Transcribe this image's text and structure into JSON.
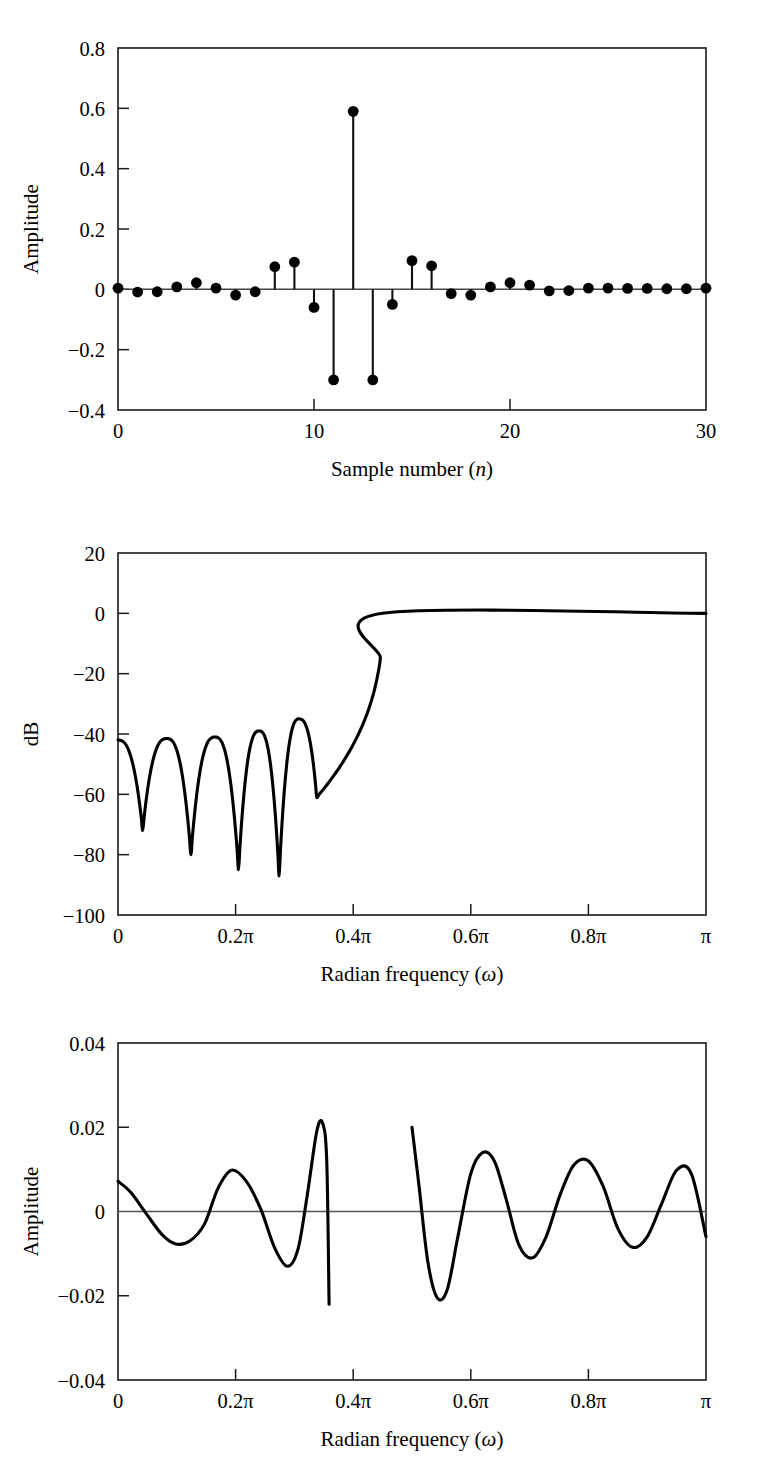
{
  "figure": {
    "panels": [
      {
        "caption": "(a)",
        "xlabel_main": "Sample number (",
        "xlabel_var": "n",
        "xlabel_tail": ")",
        "ylabel": "Amplitude"
      },
      {
        "caption": "(b)",
        "xlabel_main": "Radian frequency (",
        "xlabel_var": "ω",
        "xlabel_tail": ")",
        "ylabel": "dB"
      },
      {
        "caption": "(c)",
        "xlabel_main": "Radian frequency (",
        "xlabel_var": "ω",
        "xlabel_tail": ")",
        "ylabel": "Amplitude"
      }
    ]
  },
  "chart_data": [
    {
      "type": "scatter",
      "subtype": "stem",
      "panel": "a",
      "title": "",
      "xlabel": "Sample number (n)",
      "ylabel": "Amplitude",
      "xlim": [
        0,
        30
      ],
      "ylim": [
        -0.4,
        0.8
      ],
      "xticks": [
        0,
        10,
        20,
        30
      ],
      "xticklabels": [
        "0",
        "10",
        "20",
        "30"
      ],
      "yticks": [
        -0.4,
        -0.2,
        0,
        0.2,
        0.4,
        0.6,
        0.8
      ],
      "yticklabels": [
        "-0.4",
        "-0.2",
        "0",
        "0.2",
        "0.4",
        "0.6",
        "0.8"
      ],
      "grid": false,
      "legend": "none",
      "x": [
        0,
        1,
        2,
        3,
        4,
        5,
        6,
        7,
        8,
        9,
        10,
        11,
        12,
        13,
        14,
        15,
        16,
        17,
        18,
        19,
        20,
        21,
        22,
        23,
        24,
        25,
        26,
        27,
        28,
        29,
        30
      ],
      "values": [
        0.004,
        -0.009,
        -0.008,
        0.008,
        0.022,
        0.004,
        -0.019,
        -0.008,
        0.075,
        0.09,
        -0.06,
        -0.3,
        0.59,
        -0.3,
        -0.05,
        0.095,
        0.078,
        -0.014,
        -0.019,
        0.008,
        0.022,
        0.014,
        -0.005,
        -0.004,
        0.004,
        0.004,
        0.003,
        0.003,
        0.002,
        0.002,
        0.004
      ]
    },
    {
      "type": "line",
      "panel": "b",
      "title": "",
      "xlabel": "Radian frequency (ω)",
      "ylabel": "dB",
      "xlim": [
        0,
        1
      ],
      "ylim": [
        -100,
        20
      ],
      "xticks": [
        0,
        0.2,
        0.4,
        0.6,
        0.8,
        1
      ],
      "xticklabels": [
        "0",
        "0.2π",
        "0.4π",
        "0.6π",
        "0.8π",
        "π"
      ],
      "yticks": [
        -100,
        -80,
        -60,
        -40,
        -20,
        0,
        20
      ],
      "yticklabels": [
        "-100",
        "-80",
        "-60",
        "-40",
        "-20",
        "0",
        "20"
      ],
      "grid": false,
      "legend": "none",
      "description": "Log-magnitude response of a lowpass filter: stopband with five nulls below 0.35π, sharp transition, flat 0 dB passband",
      "stopband_nulls_x": [
        0.042,
        0.124,
        0.205,
        0.274,
        0.338
      ],
      "stopband_null_depths": [
        -72,
        -80,
        -85,
        -87,
        -61
      ],
      "stopband_peaks_x": [
        0.0,
        0.083,
        0.165,
        0.24,
        0.308
      ],
      "stopband_peak_values": [
        -42,
        -41.5,
        -41,
        -39,
        -35
      ],
      "transition_start_x": 0.338,
      "passband_start_x": 0.45,
      "passband_level": 0
    },
    {
      "type": "line",
      "panel": "c",
      "title": "",
      "xlabel": "Radian frequency (ω)",
      "ylabel": "Amplitude",
      "xlim": [
        0,
        1
      ],
      "ylim": [
        -0.04,
        0.04
      ],
      "xticks": [
        0,
        0.2,
        0.4,
        0.6,
        0.8,
        1
      ],
      "xticklabels": [
        "0",
        "0.2π",
        "0.4π",
        "0.6π",
        "0.8π",
        "π"
      ],
      "yticks": [
        -0.04,
        -0.02,
        0,
        0.02,
        0.04
      ],
      "yticklabels": [
        "-0.04",
        "-0.02",
        "0",
        "0.02",
        "0.04"
      ],
      "grid": false,
      "legend": "none",
      "description": "Approximation error: stopband ripple 0 to 0.355π and passband ripple 0.50π to π, transition band omitted",
      "segment1_x": [
        0.0,
        0.022,
        0.048,
        0.075,
        0.098,
        0.122,
        0.147,
        0.17,
        0.193,
        0.218,
        0.243,
        0.266,
        0.288,
        0.306,
        0.322,
        0.338,
        0.348,
        0.355
      ],
      "segment1_y": [
        0.0072,
        0.0045,
        -0.0005,
        -0.0055,
        -0.0077,
        -0.007,
        -0.003,
        0.0055,
        0.0098,
        0.0072,
        0.0005,
        -0.0085,
        -0.013,
        -0.009,
        0.004,
        0.019,
        0.021,
        0.012
      ],
      "segment1_end_y": -0.022,
      "segment2_x": [
        0.5,
        0.512,
        0.527,
        0.543,
        0.56,
        0.578,
        0.6,
        0.62,
        0.64,
        0.66,
        0.682,
        0.705,
        0.728,
        0.752,
        0.775,
        0.8,
        0.825,
        0.85,
        0.875,
        0.9,
        0.925,
        0.95,
        0.975,
        1.0
      ],
      "segment2_y": [
        0.02,
        0.006,
        -0.012,
        -0.0205,
        -0.0185,
        -0.006,
        0.009,
        0.014,
        0.012,
        0.003,
        -0.008,
        -0.011,
        -0.006,
        0.004,
        0.011,
        0.012,
        0.006,
        -0.004,
        -0.0085,
        -0.006,
        0.002,
        0.0098,
        0.009,
        -0.006
      ]
    }
  ]
}
